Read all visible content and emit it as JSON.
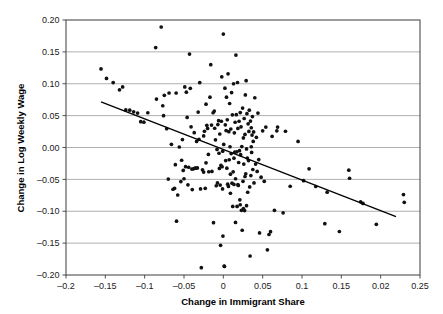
{
  "chart_data": {
    "type": "scatter",
    "title": "",
    "xlabel": "Change in Immigrant Share",
    "ylabel": "Change in Log Weekly Wage",
    "xlim": [
      -0.2,
      0.25
    ],
    "ylim": [
      -0.2,
      0.2
    ],
    "grid": "horizontal",
    "legend": "none",
    "xticks": [
      -0.2,
      -0.15,
      -0.1,
      -0.05,
      0,
      0.05,
      0.1,
      0.15,
      0.2,
      0.25
    ],
    "xtick_labels": [
      "-0.2",
      "-0.15",
      "-0.1",
      "-0.05",
      "0",
      "0.05",
      "0.1",
      "0.15",
      "0.02",
      "0.25"
    ],
    "yticks": [
      0.2,
      0.15,
      0.1,
      0.05,
      0.0,
      -0.05,
      -0.1,
      -0.15,
      -0.2
    ],
    "ytick_labels": [
      "0.20",
      "0.15",
      "0.10",
      "0.05",
      "0.00",
      "-0.05",
      "-0.10",
      "-0.15",
      "-0.20"
    ],
    "trendline": {
      "x": [
        -0.1555,
        0.2195
      ],
      "y": [
        0.0715,
        -0.1085
      ],
      "slope": -0.48,
      "intercept": -0.0035
    },
    "points": [
      [
        -0.1555,
        0.1232
      ],
      [
        -0.1485,
        0.1083
      ],
      [
        -0.14,
        0.1018
      ],
      [
        -0.132,
        0.0905
      ],
      [
        -0.128,
        0.095
      ],
      [
        -0.124,
        0.059
      ],
      [
        -0.119,
        0.0585
      ],
      [
        -0.114,
        0.056
      ],
      [
        -0.109,
        0.054
      ],
      [
        -0.105,
        0.0405
      ],
      [
        -0.101,
        0.0397
      ],
      [
        -0.096,
        0.0545
      ],
      [
        -0.086,
        0.1568
      ],
      [
        -0.085,
        0.076
      ],
      [
        -0.079,
        0.189
      ],
      [
        -0.077,
        0.0655
      ],
      [
        -0.076,
        0.05
      ],
      [
        -0.075,
        0.0818
      ],
      [
        -0.072,
        0.0295
      ],
      [
        -0.07,
        -0.0495
      ],
      [
        -0.069,
        0.0855
      ],
      [
        -0.066,
        0.005
      ],
      [
        -0.064,
        -0.0655
      ],
      [
        -0.062,
        -0.064
      ],
      [
        -0.061,
        -0.027
      ],
      [
        -0.06,
        0.0855
      ],
      [
        -0.0595,
        -0.1155
      ],
      [
        -0.058,
        -0.0745
      ],
      [
        -0.056,
        0.0008
      ],
      [
        -0.054,
        -0.0535
      ],
      [
        -0.053,
        -0.02
      ],
      [
        -0.052,
        0.0125
      ],
      [
        -0.051,
        -0.036
      ],
      [
        -0.05,
        -0.049
      ],
      [
        -0.049,
        0.095
      ],
      [
        -0.048,
        -0.03
      ],
      [
        -0.047,
        0.0868
      ],
      [
        -0.046,
        0.0472
      ],
      [
        -0.045,
        -0.0585
      ],
      [
        -0.044,
        -0.031
      ],
      [
        -0.043,
        0.1465
      ],
      [
        -0.042,
        0.0928
      ],
      [
        -0.041,
        0.0325
      ],
      [
        -0.04,
        -0.0338
      ],
      [
        -0.0395,
        -0.066
      ],
      [
        -0.038,
        -0.0335
      ],
      [
        -0.037,
        0.0232
      ],
      [
        -0.036,
        -0.0325
      ],
      [
        -0.035,
        -0.0325
      ],
      [
        -0.034,
        0.0095
      ],
      [
        -0.033,
        -0.032
      ],
      [
        -0.032,
        0.0555
      ],
      [
        -0.031,
        0.0128
      ],
      [
        -0.03,
        0.1018
      ],
      [
        -0.029,
        -0.065
      ],
      [
        -0.028,
        -0.1885
      ],
      [
        -0.0265,
        -0.035
      ],
      [
        -0.025,
        0.0182
      ],
      [
        -0.024,
        0.0255
      ],
      [
        -0.023,
        -0.064
      ],
      [
        -0.022,
        0.068
      ],
      [
        -0.021,
        0.0348
      ],
      [
        -0.02,
        0.03
      ],
      [
        -0.019,
        -0.0108
      ],
      [
        -0.0185,
        -0.038
      ],
      [
        -0.017,
        0.079
      ],
      [
        -0.016,
        0.13
      ],
      [
        -0.015,
        0.0352
      ],
      [
        -0.0145,
        -0.0375
      ],
      [
        -0.013,
        0.0545
      ],
      [
        -0.0125,
        -0.118
      ],
      [
        -0.0115,
        0.0572
      ],
      [
        -0.011,
        0.0302
      ],
      [
        -0.01,
        0.012
      ],
      [
        -0.009,
        -0.06
      ],
      [
        -0.008,
        -0.003
      ],
      [
        -0.0075,
        -0.0555
      ],
      [
        -0.007,
        0.036
      ],
      [
        -0.006,
        0.042
      ],
      [
        -0.0055,
        -0.009
      ],
      [
        -0.005,
        -0.0328
      ],
      [
        -0.0045,
        0.0212
      ],
      [
        -0.004,
        -0.059
      ],
      [
        -0.0035,
        -0.1535
      ],
      [
        -0.003,
        -0.028
      ],
      [
        -0.0025,
        0.0412
      ],
      [
        -0.002,
        0.1108
      ],
      [
        -0.0015,
        -0.0302
      ],
      [
        -0.001,
        -0.065
      ],
      [
        -0.0008,
        -0.0058
      ],
      [
        -0.0005,
        -0.139
      ],
      [
        0.0,
        0.178
      ],
      [
        0.0005,
        0.0048
      ],
      [
        0.001,
        -0.186
      ],
      [
        0.0015,
        -0.1865
      ],
      [
        0.002,
        0.093
      ],
      [
        0.0025,
        0.0355
      ],
      [
        0.003,
        -0.0205
      ],
      [
        0.0035,
        0.0265
      ],
      [
        0.004,
        0.079
      ],
      [
        0.0045,
        -0.0325
      ],
      [
        0.005,
        0.0435
      ],
      [
        0.0055,
        -0.0575
      ],
      [
        0.006,
        0.1155
      ],
      [
        0.0065,
        -0.061
      ],
      [
        0.007,
        0.0248
      ],
      [
        0.0075,
        -0.0192
      ],
      [
        0.008,
        0.069
      ],
      [
        0.0085,
        0.0012
      ],
      [
        0.009,
        -0.0418
      ],
      [
        0.0095,
        0.029
      ],
      [
        0.01,
        -0.0095
      ],
      [
        0.0105,
        0.0862
      ],
      [
        0.011,
        -0.056
      ],
      [
        0.0115,
        0.0512
      ],
      [
        0.012,
        -0.0925
      ],
      [
        0.0125,
        -0.0382
      ],
      [
        0.013,
        0.1
      ],
      [
        0.0135,
        -0.0168
      ],
      [
        0.014,
        0.023
      ],
      [
        0.0145,
        -0.0072
      ],
      [
        0.015,
        0.0396
      ],
      [
        0.0155,
        -0.1175
      ],
      [
        0.016,
        0.145
      ],
      [
        0.0165,
        0.0515
      ],
      [
        0.017,
        -0.0068
      ],
      [
        0.0175,
        -0.0925
      ],
      [
        0.018,
        0.102
      ],
      [
        0.0185,
        0.03
      ],
      [
        0.019,
        -0.0595
      ],
      [
        0.0195,
        -0.0235
      ],
      [
        0.02,
        0.0412
      ],
      [
        0.0205,
        -0.005
      ],
      [
        0.021,
        -0.082
      ],
      [
        0.0215,
        0.0548
      ],
      [
        0.022,
        -0.0112
      ],
      [
        0.0225,
        0.0325
      ],
      [
        0.023,
        -0.0985
      ],
      [
        0.0235,
        0.0015
      ],
      [
        0.024,
        -0.1298
      ],
      [
        0.0245,
        0.0618
      ],
      [
        0.025,
        -0.053
      ],
      [
        0.0255,
        0.015
      ],
      [
        0.026,
        -0.026
      ],
      [
        0.0265,
        0.0455
      ],
      [
        0.027,
        -0.099
      ],
      [
        0.0275,
        0.0205
      ],
      [
        0.028,
        0.0825
      ],
      [
        0.0285,
        -0.0412
      ],
      [
        0.029,
        0.1048
      ],
      [
        0.0295,
        -0.0022
      ],
      [
        0.03,
        0.053
      ],
      [
        0.0305,
        -0.0165
      ],
      [
        0.031,
        -0.0702
      ],
      [
        0.0315,
        0.0372
      ],
      [
        0.032,
        -0.0205
      ],
      [
        0.0325,
        0.0252
      ],
      [
        0.033,
        0.0585
      ],
      [
        0.0335,
        -0.0618
      ],
      [
        0.034,
        -0.1702
      ],
      [
        0.0345,
        0.0415
      ],
      [
        0.035,
        -0.044
      ],
      [
        0.0355,
        0.031
      ],
      [
        0.036,
        -0.0078
      ],
      [
        0.0365,
        0.0195
      ],
      [
        0.037,
        0.0485
      ],
      [
        0.0375,
        -0.0345
      ],
      [
        0.038,
        0.0095
      ],
      [
        0.039,
        -0.0555
      ],
      [
        0.04,
        0.078
      ],
      [
        0.041,
        -0.026
      ],
      [
        0.042,
        0.016
      ],
      [
        0.043,
        -0.0375
      ],
      [
        0.044,
        0.054
      ],
      [
        0.045,
        -0.019
      ],
      [
        0.046,
        -0.134
      ],
      [
        0.048,
        -0.0465
      ],
      [
        0.05,
        0.0262
      ],
      [
        0.052,
        -0.053
      ],
      [
        0.054,
        0.032
      ],
      [
        0.056,
        -0.1605
      ],
      [
        0.058,
        -0.1365
      ],
      [
        0.06,
        -0.132
      ],
      [
        0.062,
        0.0175
      ],
      [
        0.065,
        -0.0985
      ],
      [
        0.068,
        0.0262
      ],
      [
        0.069,
        0.032
      ],
      [
        0.076,
        -0.1025
      ],
      [
        0.079,
        0.0255
      ],
      [
        0.085,
        -0.0608
      ],
      [
        0.095,
        0.0095
      ],
      [
        0.102,
        -0.052
      ],
      [
        0.109,
        -0.0335
      ],
      [
        0.1175,
        -0.0612
      ],
      [
        0.129,
        -0.1195
      ],
      [
        0.132,
        -0.07
      ],
      [
        0.1475,
        -0.1318
      ],
      [
        0.1595,
        -0.0355
      ],
      [
        0.1605,
        -0.0482
      ],
      [
        0.1745,
        -0.0852
      ],
      [
        0.1775,
        -0.0878
      ],
      [
        0.1945,
        -0.1205
      ],
      [
        0.229,
        -0.0738
      ],
      [
        0.23,
        -0.086
      ],
      [
        -0.025,
        -0.0385
      ],
      [
        -0.022,
        -0.024
      ],
      [
        0.0155,
        -0.049
      ],
      [
        0.0215,
        -0.0898
      ],
      [
        0.0255,
        -0.0958
      ],
      [
        0.0275,
        -0.0455
      ],
      [
        0.0295,
        -0.0912
      ],
      [
        0.0185,
        -0.0582
      ],
      [
        0.009,
        -0.0718
      ],
      [
        0.0135,
        -0.058
      ],
      [
        0.0355,
        0.0012
      ],
      [
        0.0385,
        0.0245
      ]
    ]
  }
}
